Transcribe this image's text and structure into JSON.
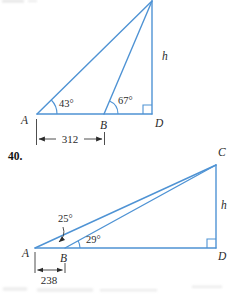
{
  "colors": {
    "diagram_line": "#4f93d4",
    "text": "#2b2b2b"
  },
  "problem39": {
    "vertex_a_label": "A",
    "vertex_b_label": "B",
    "vertex_d_label": "D",
    "height_label": "h",
    "angle_a": "43°",
    "angle_b": "67°",
    "base_measure": "312"
  },
  "problem40": {
    "number": "40.",
    "vertex_a_label": "A",
    "vertex_b_label": "B",
    "vertex_c_label": "C",
    "vertex_d_label": "D",
    "height_label": "h",
    "angle_a": "25°",
    "angle_b": "29°",
    "base_measure": "238"
  }
}
